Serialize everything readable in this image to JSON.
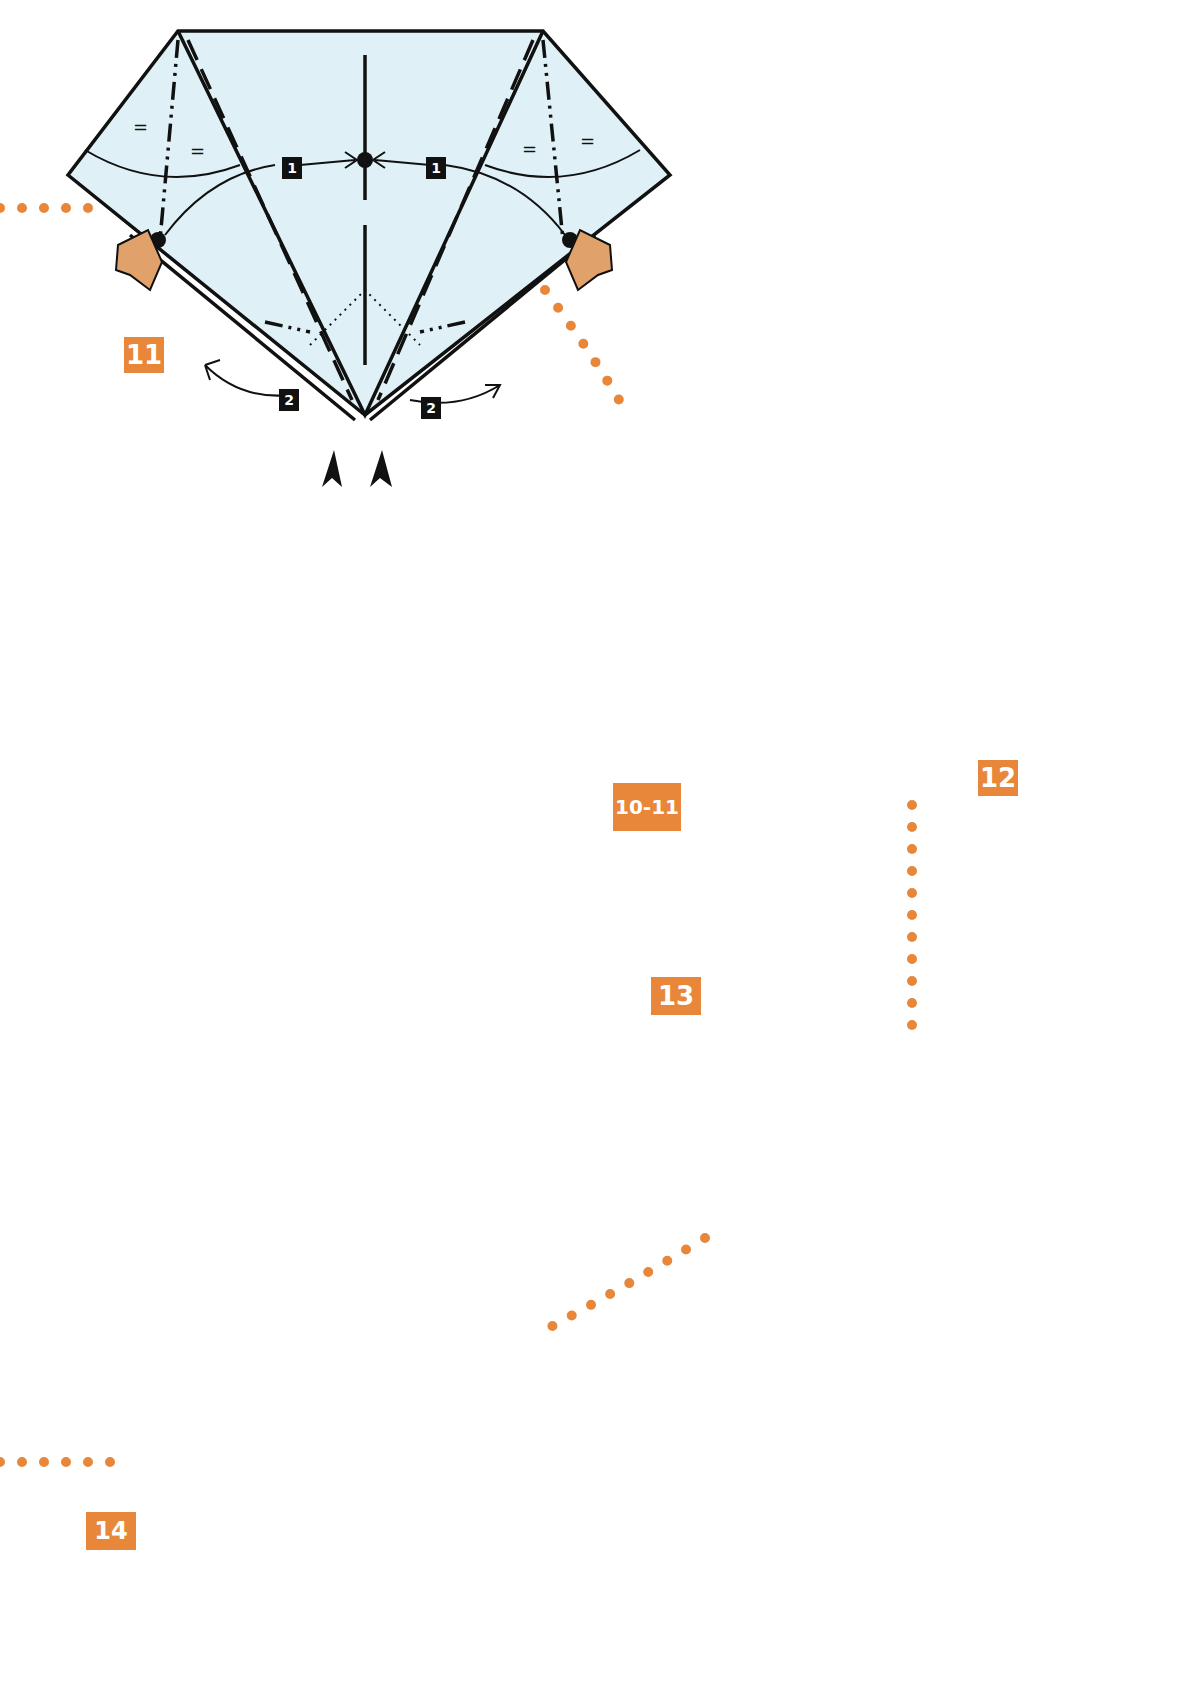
{
  "page": {
    "background": "#ffffff",
    "paper_color": "#dff1f6",
    "accent_color": "#e8873a",
    "skin_color": "#e0a16a"
  },
  "steps": [
    {
      "id": "step-11",
      "label": "11",
      "sequence_marks": [
        "1",
        "1",
        "2",
        "2"
      ],
      "equal_marks": [
        "=",
        "=",
        "=",
        "="
      ]
    },
    {
      "id": "step-12",
      "label": "12",
      "reference_label": "10-11"
    },
    {
      "id": "step-13",
      "label": "13"
    },
    {
      "id": "step-14",
      "label": "14"
    }
  ],
  "corner_tab": {
    "colors": [
      "#b9b9b9",
      "#6aaee0"
    ]
  }
}
